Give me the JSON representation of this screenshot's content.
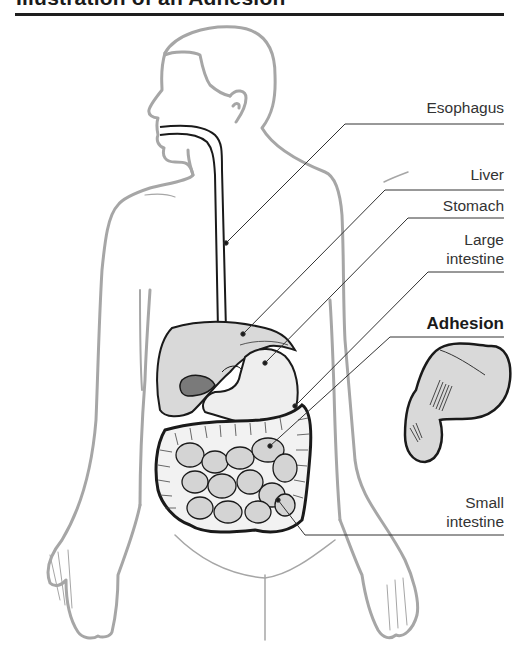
{
  "figure": {
    "title": "Illustration of an Adhesion",
    "colors": {
      "body_outline": "#a6a6a6",
      "organ_fill": "#d9d9d9",
      "organ_outline": "#1a1a1a",
      "gallbladder": "#7a7a7a",
      "leader_line": "#333333",
      "title_rule": "#1e1e1e"
    },
    "labels": [
      {
        "id": "esophagus",
        "text": "Esophagus",
        "bold": false
      },
      {
        "id": "liver",
        "text": "Liver",
        "bold": false
      },
      {
        "id": "stomach",
        "text": "Stomach",
        "bold": false
      },
      {
        "id": "large-intestine",
        "line1": "Large",
        "line2": "intestine",
        "bold": false
      },
      {
        "id": "adhesion",
        "text": "Adhesion",
        "bold": true
      },
      {
        "id": "small-intestine",
        "line1": "Small",
        "line2": "intestine",
        "bold": false
      }
    ],
    "inset": {
      "name": "Adhesion close-up",
      "depicts": "intestinal loops joined by fibrous adhesion bands"
    }
  }
}
